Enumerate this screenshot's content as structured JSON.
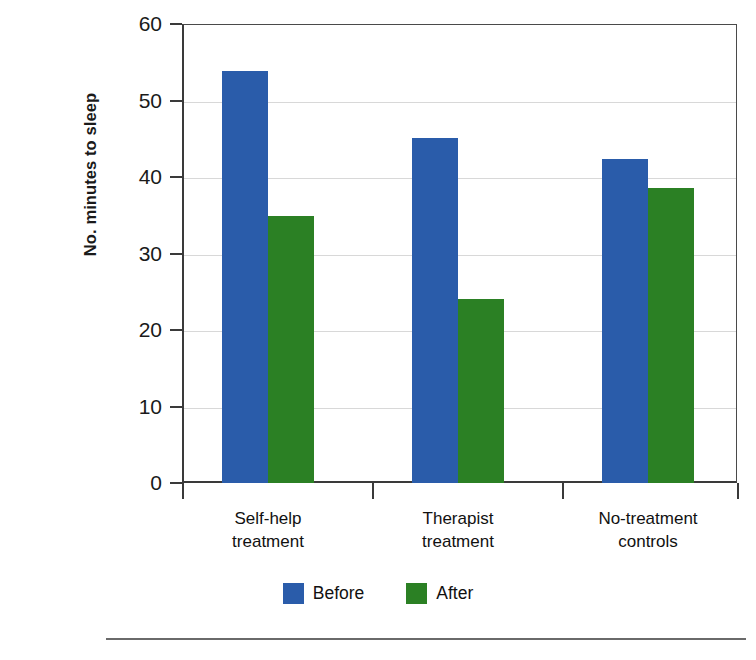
{
  "chart_data": {
    "type": "bar",
    "title": "",
    "xlabel": "",
    "ylabel": "No. minutes to sleep",
    "categories": [
      "Self-help\ntreatment",
      "Therapist\ntreatment",
      "No-treatment\ncontrols"
    ],
    "series": [
      {
        "name": "Before",
        "color": "#2a5caa",
        "values": [
          53.8,
          45.1,
          42.3
        ]
      },
      {
        "name": "After",
        "color": "#2b8024",
        "values": [
          34.9,
          24.1,
          38.5
        ]
      }
    ],
    "ylim": [
      0,
      60
    ],
    "yticks": [
      0,
      10,
      20,
      30,
      40,
      50,
      60
    ],
    "ytick_labels": [
      "0",
      "10",
      "20",
      "30",
      "40",
      "50",
      "60"
    ],
    "grid": true,
    "legend_position": "bottom"
  },
  "legend": {
    "items": [
      {
        "label": "Before",
        "color": "#2a5caa"
      },
      {
        "label": "After",
        "color": "#2b8024"
      }
    ]
  },
  "axis": {
    "y_title": "No. minutes to sleep"
  }
}
